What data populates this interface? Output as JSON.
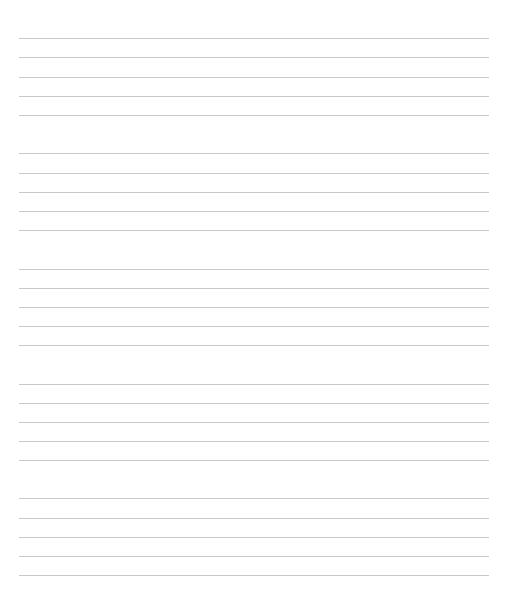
{
  "page": {
    "background": "#ffffff",
    "line_color": "#c9c9c9",
    "line_left": 19,
    "line_right": 489
  },
  "line_groups": [
    {
      "lines_y": [
        38,
        57,
        77,
        96,
        115
      ]
    },
    {
      "lines_y": [
        153,
        173,
        192,
        211,
        230
      ]
    },
    {
      "lines_y": [
        269,
        288,
        307,
        326,
        345
      ]
    },
    {
      "lines_y": [
        384,
        403,
        422,
        441,
        460
      ]
    },
    {
      "lines_y": [
        498,
        518,
        537,
        556,
        575
      ]
    }
  ]
}
